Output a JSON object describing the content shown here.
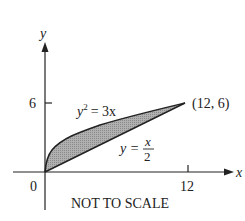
{
  "diagram": {
    "type": "region-between-curves",
    "axes": {
      "x_label": "x",
      "y_label": "y",
      "origin_label": "0",
      "x_tick_label": "12",
      "y_tick_label": "6"
    },
    "curves": [
      {
        "name": "parabola",
        "equation_lhs": "y",
        "equation_exp": "2",
        "equation_rhs": "= 3x"
      },
      {
        "name": "line",
        "equation_lhs": "y =",
        "numerator": "x",
        "denominator": "2"
      }
    ],
    "intersection_label": "(12, 6)",
    "caption": "NOT TO SCALE",
    "colors": {
      "shade": "#a8a8a8",
      "stroke": "#222222"
    }
  }
}
